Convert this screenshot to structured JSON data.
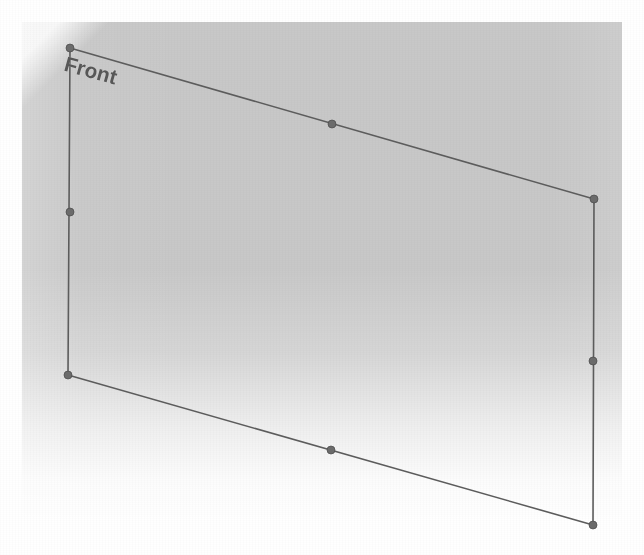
{
  "viewport": {
    "width": 644,
    "height": 555,
    "background_color": "#ffffff",
    "shaded_region_color": "#c8c8c8"
  },
  "annotation": {
    "face_label": "Front",
    "label_color": "#575757",
    "label_rotation_deg": 15.5
  },
  "geometry": {
    "edge_color": "#5c5c5c",
    "edge_width": 1.6,
    "node_color": "#6b6b6b",
    "node_radius": 4,
    "outline_points": "70,48 594,199 593,525 68,375",
    "edges": [
      {
        "name": "top-edge",
        "x1": 70,
        "y1": 48,
        "x2": 594,
        "y2": 199
      },
      {
        "name": "right-edge",
        "x1": 594,
        "y1": 199,
        "x2": 593,
        "y2": 525
      },
      {
        "name": "bottom-edge",
        "x1": 593,
        "y1": 525,
        "x2": 68,
        "y2": 375
      },
      {
        "name": "left-edge",
        "x1": 68,
        "y1": 375,
        "x2": 70,
        "y2": 48
      }
    ],
    "nodes": [
      {
        "name": "corner-top-left",
        "x": 70,
        "y": 48
      },
      {
        "name": "midpoint-top",
        "x": 332,
        "y": 124
      },
      {
        "name": "corner-top-right",
        "x": 594,
        "y": 199
      },
      {
        "name": "midpoint-right",
        "x": 593,
        "y": 361
      },
      {
        "name": "corner-bottom-right",
        "x": 593,
        "y": 525
      },
      {
        "name": "midpoint-bottom",
        "x": 331,
        "y": 450
      },
      {
        "name": "corner-bottom-left",
        "x": 68,
        "y": 375
      },
      {
        "name": "midpoint-left",
        "x": 70,
        "y": 212
      }
    ]
  }
}
